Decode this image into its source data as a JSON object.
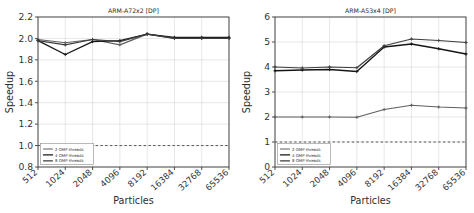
{
  "figure": {
    "width": 474,
    "height": 213,
    "background": "#ffffff"
  },
  "chart_data": [
    {
      "type": "line",
      "title": "ARM-A72x2   [DP]",
      "xlabel": "Particles",
      "ylabel": "Speedup",
      "categories": [
        "512",
        "1024",
        "2048",
        "4096",
        "8192",
        "16384",
        "32768",
        "65536"
      ],
      "ylim": [
        0.8,
        2.2
      ],
      "yticks": [
        "0.8",
        "1.0",
        "1.2",
        "1.4",
        "1.6",
        "1.8",
        "2.0",
        "2.2"
      ],
      "grid": true,
      "legend_position": "lower left",
      "reference_line": 1.0,
      "series": [
        {
          "name": "2 OMP threads",
          "color": "#5f5f5f",
          "values": [
            1.99,
            1.96,
            1.99,
            1.94,
            2.04,
            2.0,
            2.0,
            2.0
          ]
        },
        {
          "name": "4 OMP threads",
          "color": "#161616",
          "values": [
            1.98,
            1.85,
            1.97,
            1.98,
            2.04,
            2.01,
            2.01,
            2.01
          ]
        },
        {
          "name": "8 OMP threads",
          "color": "#3d3d3d",
          "values": [
            1.98,
            1.94,
            1.99,
            1.97,
            2.04,
            2.0,
            2.0,
            2.0
          ]
        }
      ]
    },
    {
      "type": "line",
      "title": "ARM-A53x4   [DP]",
      "xlabel": "Particles",
      "ylabel": "Speedup",
      "categories": [
        "512",
        "1024",
        "2048",
        "4096",
        "8192",
        "16384",
        "32768",
        "65536"
      ],
      "ylim": [
        0,
        6
      ],
      "yticks": [
        "0",
        "1",
        "2",
        "3",
        "4",
        "5",
        "6"
      ],
      "grid": true,
      "legend_position": "lower left",
      "reference_line": 1.0,
      "series": [
        {
          "name": "2 OMP threads",
          "color": "#5f5f5f",
          "values": [
            2.0,
            2.0,
            2.0,
            1.99,
            2.3,
            2.47,
            2.4,
            2.36
          ]
        },
        {
          "name": "4 OMP threads",
          "color": "#161616",
          "values": [
            3.85,
            3.88,
            3.9,
            3.82,
            4.8,
            4.92,
            4.73,
            4.52
          ]
        },
        {
          "name": "8 OMP threads",
          "color": "#3d3d3d",
          "values": [
            4.0,
            3.96,
            4.0,
            3.97,
            4.85,
            5.12,
            5.06,
            4.98
          ]
        }
      ]
    }
  ],
  "legend": {
    "entries": [
      "2 OMP threads",
      "4 OMP threads",
      "8 OMP threads"
    ]
  }
}
